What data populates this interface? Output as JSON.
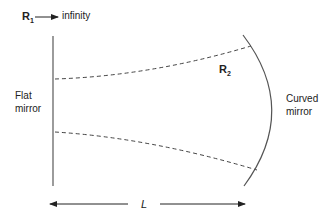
{
  "diagram": {
    "r1_label": "R",
    "r1_sub": "1",
    "r1_value": "infinity",
    "r2_label": "R",
    "r2_sub": "2",
    "flat_mirror_line1": "Flat",
    "flat_mirror_line2": "mirror",
    "curved_mirror_line1": "Curved",
    "curved_mirror_line2": "mirror",
    "length_label": "L"
  },
  "colors": {
    "line": "#555555",
    "dashed": "#444444",
    "text": "#222222"
  }
}
